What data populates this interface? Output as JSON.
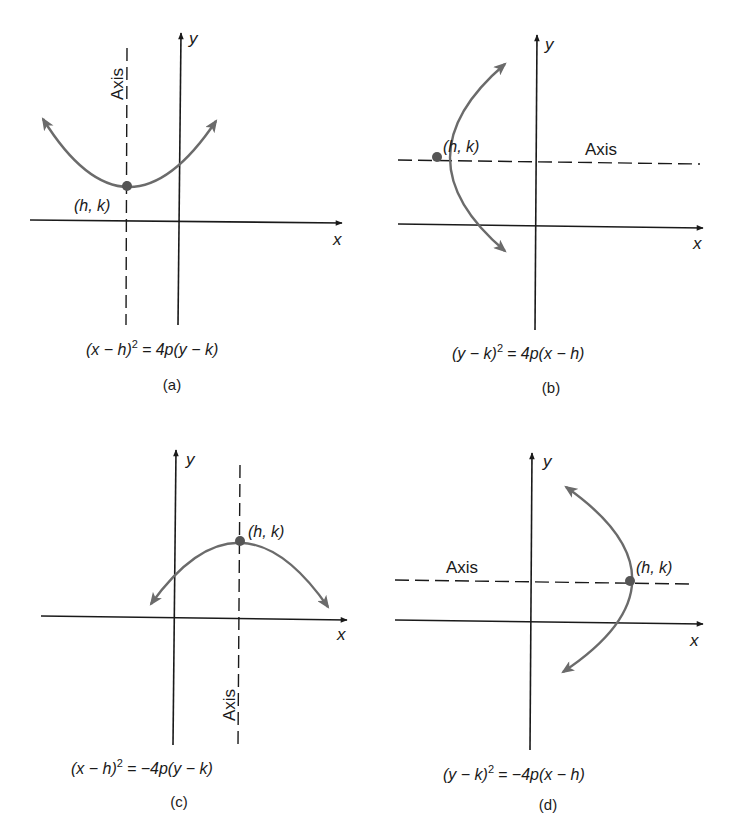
{
  "figure": {
    "panels": [
      {
        "id": "a",
        "caption": "(a)",
        "equation": "(x − h)² = 4p(y − k)",
        "equation_parts": {
          "lhs_open": "(x − h)",
          "exp": "2",
          "rhs": "= 4p(y − k)"
        },
        "vertex_label": "(h, k)",
        "axis_label": "Axis",
        "x_label": "x",
        "y_label": "y",
        "opens": "up"
      },
      {
        "id": "b",
        "caption": "(b)",
        "equation": "(y − k)² = 4p(x − h)",
        "equation_parts": {
          "lhs_open": "(y − k)",
          "exp": "2",
          "rhs": "= 4p(x − h)"
        },
        "vertex_label": "(h, k)",
        "axis_label": "Axis",
        "x_label": "x",
        "y_label": "y",
        "opens": "right"
      },
      {
        "id": "c",
        "caption": "(c)",
        "equation": "(x − h)² = −4p(y − k)",
        "equation_parts": {
          "lhs_open": "(x − h)",
          "exp": "2",
          "rhs": "= −4p(y − k)"
        },
        "vertex_label": "(h, k)",
        "axis_label": "Axis",
        "x_label": "x",
        "y_label": "y",
        "opens": "down"
      },
      {
        "id": "d",
        "caption": "(d)",
        "equation": "(y − k)² = −4p(x − h)",
        "equation_parts": {
          "lhs_open": "(y − k)",
          "exp": "2",
          "rhs": "= −4p(x − h)"
        },
        "vertex_label": "(h, k)",
        "axis_label": "Axis",
        "x_label": "x",
        "y_label": "y",
        "opens": "left"
      }
    ],
    "colors": {
      "axis": "#1a1a1a",
      "curve": "#6b6b6b",
      "vertex": "#555555"
    }
  }
}
